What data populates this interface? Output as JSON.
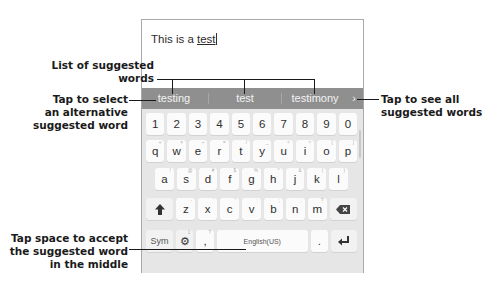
{
  "text_field": {
    "prefix": "This is a ",
    "underlined_word": "test"
  },
  "suggestions": {
    "items": [
      "testing",
      "test",
      "testimony"
    ],
    "more_icon": "chevron-right-icon"
  },
  "keyboard": {
    "number_row": [
      "1",
      "2",
      "3",
      "4",
      "5",
      "6",
      "7",
      "8",
      "9",
      "0"
    ],
    "row_q": [
      {
        "k": "q",
        "h": "+"
      },
      {
        "k": "w",
        "h": "×"
      },
      {
        "k": "e",
        "h": "÷"
      },
      {
        "k": "r",
        "h": "="
      },
      {
        "k": "t",
        "h": "/"
      },
      {
        "k": "y",
        "h": "_"
      },
      {
        "k": "u",
        "h": "<"
      },
      {
        "k": "i",
        "h": ">"
      },
      {
        "k": "o",
        "h": "["
      },
      {
        "k": "p",
        "h": "]"
      }
    ],
    "row_a": [
      {
        "k": "a",
        "h": "!"
      },
      {
        "k": "s",
        "h": "@"
      },
      {
        "k": "d",
        "h": "#"
      },
      {
        "k": "f",
        "h": "$"
      },
      {
        "k": "g",
        "h": "%"
      },
      {
        "k": "h",
        "h": "^"
      },
      {
        "k": "j",
        "h": "&"
      },
      {
        "k": "k",
        "h": "("
      },
      {
        "k": "l",
        "h": ")"
      }
    ],
    "row_z": [
      {
        "k": "z",
        "h": "-"
      },
      {
        "k": "x",
        "h": "'"
      },
      {
        "k": "c",
        "h": "\""
      },
      {
        "k": "v",
        "h": ":"
      },
      {
        "k": "b",
        "h": ";"
      },
      {
        "k": "n",
        "h": ","
      },
      {
        "k": "m",
        "h": "?"
      }
    ],
    "shift_icon": "shift-arrow-icon",
    "delete_icon": "backspace-icon",
    "sym_label": "Sym",
    "settings_icon": "gear-icon",
    "settings_hint": "1",
    "comma_label": ",",
    "comma_hint": "?",
    "space_label": "English(US)",
    "period_label": ".",
    "enter_icon": "enter-icon"
  },
  "annotations": {
    "list_of_suggested_words": [
      "List of suggested",
      "words"
    ],
    "tap_to_select": [
      "Tap to select",
      "an alternative",
      "suggested word"
    ],
    "tap_to_see_all": [
      "Tap to see all",
      "suggested words"
    ],
    "tap_space": [
      "Tap space to accept",
      "the suggested word",
      "in the middle"
    ]
  },
  "colors": {
    "suggestion_bar": "#8f8f8f",
    "keyboard_bg": "#e6e6e6",
    "key_bg": "#fbfbfb",
    "annotation_text": "#1a1a1a"
  }
}
